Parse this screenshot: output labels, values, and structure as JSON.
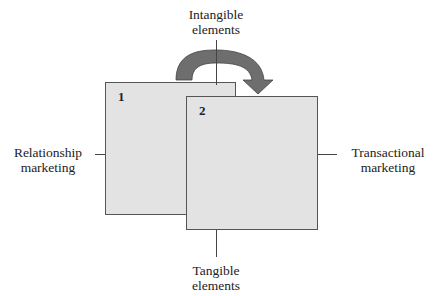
{
  "diagram": {
    "axes": {
      "top": [
        "Intangible",
        "elements"
      ],
      "bottom": [
        "Tangible",
        "elements"
      ],
      "left": [
        "Relationship",
        "marketing"
      ],
      "right": [
        "Transactional",
        "marketing"
      ]
    },
    "boxes": [
      {
        "id": "1",
        "label": "1"
      },
      {
        "id": "2",
        "label": "2"
      }
    ],
    "arrow": {
      "from": "1",
      "to": "2",
      "color": "#6e6e6e"
    },
    "colors": {
      "box_fill": "#e3e3e3",
      "box_border": "#555555",
      "line": "#444444"
    }
  }
}
